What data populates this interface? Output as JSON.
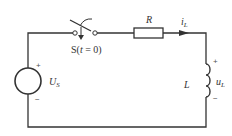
{
  "circuit": {
    "source": {
      "label": "U",
      "subscript": "S",
      "plus": "+",
      "minus": "−"
    },
    "switch": {
      "label_prefix": "S(",
      "label_var": "t",
      "label_suffix": " = 0)"
    },
    "resistor": {
      "label": "R"
    },
    "current": {
      "label": "i",
      "subscript": "L"
    },
    "inductor": {
      "label": "L",
      "voltage_label": "u",
      "voltage_subscript": "L",
      "plus": "+",
      "minus": "−"
    },
    "colors": {
      "wire": "#333333",
      "background": "#ffffff"
    }
  }
}
